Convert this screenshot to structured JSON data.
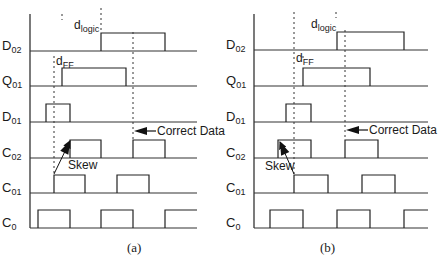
{
  "figure": {
    "panels": [
      {
        "id": "a",
        "caption": "(a)",
        "axis_x": 30,
        "axis_top": 14,
        "axis_bottom": 228,
        "baseline_end_x": 197,
        "pulse_height": 18,
        "signals": [
          {
            "name": "D",
            "sub": "02",
            "baseline_y": 51,
            "pulses": [
              [
                101,
                165
              ]
            ],
            "open_end": false
          },
          {
            "name": "Q",
            "sub": "01",
            "baseline_y": 86,
            "pulses": [
              [
                62,
                126
              ]
            ],
            "open_end": false
          },
          {
            "name": "D",
            "sub": "01",
            "baseline_y": 122,
            "pulses": [
              [
                46,
                70
              ]
            ],
            "open_end": false
          },
          {
            "name": "C",
            "sub": "02",
            "baseline_y": 158,
            "pulses": [
              [
                70,
                101
              ],
              [
                133,
                165
              ]
            ],
            "open_end": false
          },
          {
            "name": "C",
            "sub": "01",
            "baseline_y": 193,
            "pulses": [
              [
                54,
                85
              ],
              [
                117,
                149
              ]
            ],
            "open_end": false
          },
          {
            "name": "C",
            "sub": "0",
            "baseline_y": 228,
            "pulses": [
              [
                38,
                70
              ],
              [
                101,
                133
              ],
              [
                165,
                197
              ]
            ],
            "open_end": true
          }
        ],
        "dashed_lines": [
          {
            "x": 54,
            "y1": 56,
            "y2": 176
          },
          {
            "x": 62,
            "y1": 14,
            "y2": 20
          },
          {
            "x": 101,
            "y1": 8,
            "y2": 32
          },
          {
            "x": 133,
            "y1": 32,
            "y2": 140
          }
        ],
        "annotations": {
          "d_logic": {
            "main": "d",
            "sub": "logic",
            "x": 74,
            "y": 29
          },
          "d_ff": {
            "main": "d",
            "sub": "FF",
            "x": 56,
            "y": 65
          },
          "correct_data": {
            "text": "Correct Data",
            "arrow_tip_x": 134,
            "arrow_tail_x": 156,
            "y": 131,
            "text_x": 157
          },
          "skew": {
            "text": "Skew",
            "text_x": 68,
            "text_y": 169,
            "from": [
              54,
              174
            ],
            "to": [
              70,
              141
            ]
          }
        }
      },
      {
        "id": "b",
        "caption": "(b)",
        "axis_x": 254,
        "axis_top": 14,
        "axis_bottom": 228,
        "baseline_end_x": 428,
        "pulse_height": 18,
        "signals": [
          {
            "name": "D",
            "sub": "02",
            "baseline_y": 50,
            "pulses": [
              [
                337,
                404
              ]
            ],
            "open_end": false
          },
          {
            "name": "Q",
            "sub": "01",
            "baseline_y": 86,
            "pulses": [
              [
                303,
                370
              ]
            ],
            "open_end": false
          },
          {
            "name": "D",
            "sub": "01",
            "baseline_y": 122,
            "pulses": [
              [
                286,
                311
              ]
            ],
            "open_end": false
          },
          {
            "name": "C",
            "sub": "02",
            "baseline_y": 158,
            "pulses": [
              [
                278,
                311
              ],
              [
                345,
                378
              ]
            ],
            "open_end": false
          },
          {
            "name": "C",
            "sub": "01",
            "baseline_y": 193,
            "pulses": [
              [
                294,
                328
              ],
              [
                362,
                395
              ]
            ],
            "open_end": false
          },
          {
            "name": "C",
            "sub": "0",
            "baseline_y": 228,
            "pulses": [
              [
                270,
                303
              ],
              [
                337,
                370
              ],
              [
                404,
                428
              ]
            ],
            "open_end": true
          }
        ],
        "dashed_lines": [
          {
            "x": 294,
            "y1": 12,
            "y2": 175
          },
          {
            "x": 303,
            "y1": 56,
            "y2": 60
          },
          {
            "x": 336,
            "y1": 12,
            "y2": 18
          },
          {
            "x": 345,
            "y1": 30,
            "y2": 140
          }
        ],
        "annotations": {
          "d_logic": {
            "main": "d",
            "sub": "logic",
            "x": 311,
            "y": 28
          },
          "d_ff": {
            "main": "d",
            "sub": "FF",
            "x": 296,
            "y": 62
          },
          "correct_data": {
            "text": "Correct Data",
            "arrow_tip_x": 346,
            "arrow_tail_x": 368,
            "y": 130,
            "text_x": 369
          },
          "skew": {
            "text": "Skew",
            "text_x": 265,
            "text_y": 170,
            "from": [
              294,
              174
            ],
            "to": [
              280,
              142
            ]
          }
        }
      }
    ]
  }
}
